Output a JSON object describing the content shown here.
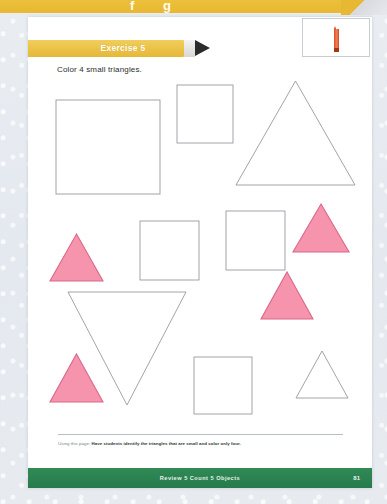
{
  "worksheet": {
    "exercise_label": "Exercise 5",
    "instruction": "Color 4 small triangles.",
    "top_band": {
      "glyph_left": "f",
      "glyph_right": "g"
    },
    "crayon_icon": "crayon-icon",
    "usage_note": {
      "lead": "Using this page:",
      "body": "Have students identify the triangles that are small and color only four."
    },
    "footer": {
      "title": "Review 5  Count 5 Objects",
      "page_number": "81"
    },
    "colors": {
      "banner_yellow": "#ecc44a",
      "pencil_tip": "#2b2b2b",
      "crayon_red": "#e05a32",
      "shape_outline": "#8a8d93",
      "filled_pink": "#f693ad",
      "pink_outline": "#d9698a",
      "footer_green": "#2b8150",
      "page_white": "#ffffff"
    },
    "shapes": [
      {
        "id": "square-large-1",
        "type": "square",
        "size": "large",
        "fill": "white",
        "x": 28,
        "y": 21,
        "w": 104,
        "h": 94
      },
      {
        "id": "square-medium-1",
        "type": "square",
        "size": "medium",
        "fill": "white",
        "x": 149,
        "y": 6,
        "w": 56,
        "h": 58
      },
      {
        "id": "triangle-large-1",
        "type": "triangle-up",
        "size": "large",
        "fill": "white",
        "x": 208,
        "y": 2,
        "w": 119,
        "h": 104
      },
      {
        "id": "square-medium-2",
        "type": "square",
        "size": "medium",
        "fill": "white",
        "x": 112,
        "y": 142,
        "w": 59,
        "h": 59
      },
      {
        "id": "square-medium-3",
        "type": "square",
        "size": "medium",
        "fill": "white",
        "x": 198,
        "y": 132,
        "w": 59,
        "h": 59
      },
      {
        "id": "triangle-small-1",
        "type": "triangle-up",
        "size": "small",
        "fill": "pink",
        "x": 22,
        "y": 155,
        "w": 53,
        "h": 47
      },
      {
        "id": "triangle-small-2",
        "type": "triangle-up",
        "size": "small",
        "fill": "pink",
        "x": 265,
        "y": 125,
        "w": 56,
        "h": 48
      },
      {
        "id": "triangle-large-2",
        "type": "triangle-down",
        "size": "large",
        "fill": "white",
        "x": 40,
        "y": 213,
        "w": 118,
        "h": 113
      },
      {
        "id": "triangle-small-3",
        "type": "triangle-up",
        "size": "small",
        "fill": "pink",
        "x": 233,
        "y": 193,
        "w": 52,
        "h": 47
      },
      {
        "id": "square-medium-4",
        "type": "square",
        "size": "medium",
        "fill": "white",
        "x": 166,
        "y": 278,
        "w": 58,
        "h": 57
      },
      {
        "id": "triangle-small-4",
        "type": "triangle-up",
        "size": "small",
        "fill": "white",
        "x": 268,
        "y": 272,
        "w": 52,
        "h": 47
      },
      {
        "id": "triangle-small-5",
        "type": "triangle-up",
        "size": "small",
        "fill": "pink",
        "x": 22,
        "y": 275,
        "w": 53,
        "h": 48
      }
    ]
  }
}
